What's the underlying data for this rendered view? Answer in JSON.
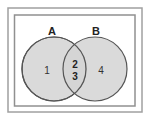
{
  "diagram": {
    "type": "venn",
    "sets": [
      {
        "name": "A",
        "label": "A"
      },
      {
        "name": "B",
        "label": "B"
      }
    ],
    "regions": {
      "only_a": "1",
      "intersection_top": "2",
      "intersection_bottom": "3",
      "only_b": "4"
    },
    "colors": {
      "circle_fill": "#d3d3d3",
      "circle_stroke": "#555555",
      "frame_stroke": "#9a9a9a",
      "background": "#ffffff"
    }
  }
}
